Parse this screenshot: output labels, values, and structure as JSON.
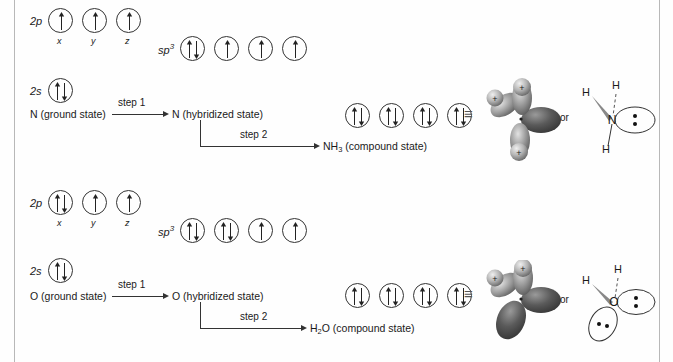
{
  "diagram": {
    "equiv_symbol": "≡",
    "or_label": "or"
  },
  "sections": [
    {
      "id": "nitrogen",
      "element": "N",
      "p_label": "2p",
      "s_label": "2s",
      "sp3_label": "sp",
      "sp3_sup": "3",
      "sub_x": "x",
      "sub_y": "y",
      "sub_z": "z",
      "p_orbitals": [
        "up",
        "up",
        "up"
      ],
      "s_orbitals": [
        "pair"
      ],
      "sp3_orbitals": [
        "pair",
        "up",
        "up",
        "up"
      ],
      "compound_orbitals": [
        "pair",
        "pair",
        "pair",
        "pair"
      ],
      "ground_label": "N (ground state)",
      "hybrid_label": "N (hybridized state)",
      "step1_label": "step 1",
      "step2_label": "step 2",
      "compound_label": "NH3 (compound state)",
      "compound_formula_main": "NH",
      "compound_formula_sub": "3",
      "compound_formula_rest": " (compound state)",
      "lewis": {
        "center": "N",
        "hydrogens": [
          "H",
          "H",
          "H"
        ],
        "lone_pairs": 1
      }
    },
    {
      "id": "oxygen",
      "element": "O",
      "p_label": "2p",
      "s_label": "2s",
      "sp3_label": "sp",
      "sp3_sup": "3",
      "sub_x": "x",
      "sub_y": "y",
      "sub_z": "z",
      "p_orbitals": [
        "pair",
        "up",
        "up"
      ],
      "s_orbitals": [
        "pair"
      ],
      "sp3_orbitals": [
        "pair",
        "pair",
        "up",
        "up"
      ],
      "compound_orbitals": [
        "pair",
        "pair",
        "pair",
        "pair"
      ],
      "ground_label": "O (ground state)",
      "hybrid_label": "O (hybridized state)",
      "step1_label": "step 1",
      "step2_label": "step 2",
      "compound_label": "H2O (compound state)",
      "compound_formula_main": "H",
      "compound_formula_sub": "2",
      "compound_formula_rest": "O (compound state)",
      "lewis": {
        "center": "O",
        "hydrogens": [
          "H",
          "H"
        ],
        "lone_pairs": 2
      }
    }
  ],
  "colors": {
    "ink": "#1a1a1a",
    "line": "#333333",
    "rule": "#b8b8b8",
    "lobe_dark": "#4a4a4a",
    "lobe_light": "#c9c9c9",
    "background": "#fefefe"
  }
}
